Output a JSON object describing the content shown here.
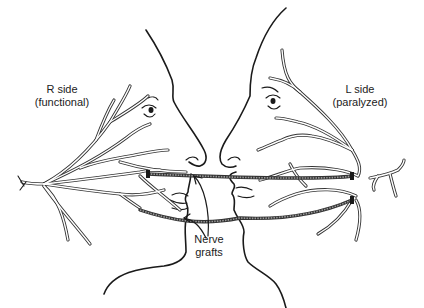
{
  "diagram": {
    "type": "medical-illustration",
    "labels": {
      "right_side": {
        "line1": "R side",
        "line2": "(functional)"
      },
      "left_side": {
        "line1": "L side",
        "line2": "(paralyzed)"
      },
      "grafts": {
        "line1": "Nerve",
        "line2": "grafts"
      }
    },
    "elements": {
      "left_face": "right-facing profile with facial nerve branches (functional)",
      "right_face": "left-facing profile with facial nerve branches (paralyzed)",
      "graft_count": 2,
      "arrow_count": 2
    },
    "colors": {
      "line": "#1a1a1a",
      "background": "#ffffff"
    }
  }
}
